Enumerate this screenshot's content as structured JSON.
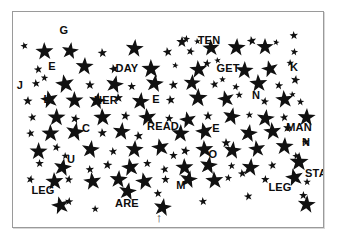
{
  "image": {
    "title": "Star field visual search puzzle",
    "background_color": "#ffffff",
    "border_color": "#9a9a9a",
    "star_color": "#111111",
    "text_color": "#0d0d0d"
  },
  "frame": {
    "x": 12,
    "y": 11,
    "width": 310,
    "height": 215
  },
  "words": [
    {
      "text": "G",
      "x": 48,
      "y": 12
    },
    {
      "text": "TEN",
      "x": 187,
      "y": 22
    },
    {
      "text": "E",
      "x": 36,
      "y": 48
    },
    {
      "text": "DAY",
      "x": 105,
      "y": 50
    },
    {
      "text": "GET",
      "x": 206,
      "y": 50
    },
    {
      "text": "K",
      "x": 278,
      "y": 49
    },
    {
      "text": "J",
      "x": 4,
      "y": 67
    },
    {
      "text": "L",
      "x": 31,
      "y": 81
    },
    {
      "text": "HER",
      "x": 84,
      "y": 82
    },
    {
      "text": "E",
      "x": 140,
      "y": 81
    },
    {
      "text": "N",
      "x": 240,
      "y": 77
    },
    {
      "text": "C",
      "x": 70,
      "y": 110
    },
    {
      "text": "READ",
      "x": 138,
      "y": 108
    },
    {
      "text": "E",
      "x": 200,
      "y": 110
    },
    {
      "text": "MAN",
      "x": 277,
      "y": 109
    },
    {
      "text": "U",
      "x": 55,
      "y": 141
    },
    {
      "text": "O",
      "x": 197,
      "y": 136
    },
    {
      "text": "N",
      "x": 290,
      "y": 124
    },
    {
      "text": "LEG",
      "x": 21,
      "y": 172
    },
    {
      "text": "M",
      "x": 165,
      "y": 167
    },
    {
      "text": "LEG",
      "x": 258,
      "y": 169
    },
    {
      "text": "STAR",
      "x": 295,
      "y": 155
    },
    {
      "text": "ARE",
      "x": 105,
      "y": 185
    }
  ],
  "marker": {
    "icon": "up-arrow-icon",
    "glyph": "↑",
    "x": 146,
    "y": 205,
    "size": 13
  },
  "stars": [
    {
      "x": 6,
      "y": 24,
      "s": 8
    },
    {
      "x": 22,
      "y": 30,
      "s": 19
    },
    {
      "x": 48,
      "y": 30,
      "s": 18
    },
    {
      "x": 84,
      "y": 32,
      "s": 10
    },
    {
      "x": 112,
      "y": 27,
      "s": 19
    },
    {
      "x": 149,
      "y": 31,
      "s": 10
    },
    {
      "x": 163,
      "y": 22,
      "s": 12
    },
    {
      "x": 174,
      "y": 30,
      "s": 9
    },
    {
      "x": 189,
      "y": 27,
      "s": 18
    },
    {
      "x": 170,
      "y": 17,
      "s": 8
    },
    {
      "x": 180,
      "y": 19,
      "s": 7
    },
    {
      "x": 214,
      "y": 26,
      "s": 19
    },
    {
      "x": 233,
      "y": 20,
      "s": 10
    },
    {
      "x": 243,
      "y": 26,
      "s": 18
    },
    {
      "x": 261,
      "y": 20,
      "s": 7
    },
    {
      "x": 276,
      "y": 14,
      "s": 9
    },
    {
      "x": 278,
      "y": 30,
      "s": 8
    },
    {
      "x": 20,
      "y": 48,
      "s": 9
    },
    {
      "x": 62,
      "y": 45,
      "s": 19
    },
    {
      "x": 95,
      "y": 48,
      "s": 10
    },
    {
      "x": 128,
      "y": 47,
      "s": 20
    },
    {
      "x": 160,
      "y": 43,
      "s": 7
    },
    {
      "x": 176,
      "y": 48,
      "s": 19
    },
    {
      "x": 190,
      "y": 42,
      "s": 9
    },
    {
      "x": 200,
      "y": 38,
      "s": 7
    },
    {
      "x": 222,
      "y": 49,
      "s": 19
    },
    {
      "x": 248,
      "y": 48,
      "s": 18
    },
    {
      "x": 273,
      "y": 41,
      "s": 8
    },
    {
      "x": 278,
      "y": 59,
      "s": 10
    },
    {
      "x": 18,
      "y": 62,
      "s": 9
    },
    {
      "x": 28,
      "y": 56,
      "s": 8
    },
    {
      "x": 42,
      "y": 62,
      "s": 20
    },
    {
      "x": 72,
      "y": 64,
      "s": 10
    },
    {
      "x": 92,
      "y": 63,
      "s": 19
    },
    {
      "x": 114,
      "y": 65,
      "s": 9
    },
    {
      "x": 132,
      "y": 62,
      "s": 19
    },
    {
      "x": 155,
      "y": 64,
      "s": 10
    },
    {
      "x": 170,
      "y": 62,
      "s": 18
    },
    {
      "x": 196,
      "y": 63,
      "s": 9
    },
    {
      "x": 206,
      "y": 57,
      "s": 7
    },
    {
      "x": 220,
      "y": 65,
      "s": 8
    },
    {
      "x": 236,
      "y": 62,
      "s": 19
    },
    {
      "x": 262,
      "y": 64,
      "s": 9
    },
    {
      "x": 275,
      "y": 72,
      "s": 7
    },
    {
      "x": 10,
      "y": 80,
      "s": 10
    },
    {
      "x": 27,
      "y": 78,
      "s": 19
    },
    {
      "x": 52,
      "y": 79,
      "s": 19
    },
    {
      "x": 75,
      "y": 80,
      "s": 18
    },
    {
      "x": 100,
      "y": 77,
      "s": 10
    },
    {
      "x": 118,
      "y": 80,
      "s": 19
    },
    {
      "x": 152,
      "y": 79,
      "s": 10
    },
    {
      "x": 175,
      "y": 76,
      "s": 20
    },
    {
      "x": 204,
      "y": 78,
      "s": 18
    },
    {
      "x": 222,
      "y": 73,
      "s": 8
    },
    {
      "x": 248,
      "y": 80,
      "s": 9
    },
    {
      "x": 262,
      "y": 78,
      "s": 19
    },
    {
      "x": 284,
      "y": 80,
      "s": 8
    },
    {
      "x": 14,
      "y": 96,
      "s": 9
    },
    {
      "x": 34,
      "y": 96,
      "s": 19
    },
    {
      "x": 58,
      "y": 98,
      "s": 10
    },
    {
      "x": 80,
      "y": 96,
      "s": 19
    },
    {
      "x": 108,
      "y": 95,
      "s": 10
    },
    {
      "x": 125,
      "y": 96,
      "s": 19
    },
    {
      "x": 152,
      "y": 97,
      "s": 9
    },
    {
      "x": 166,
      "y": 99,
      "s": 18
    },
    {
      "x": 190,
      "y": 95,
      "s": 10
    },
    {
      "x": 209,
      "y": 95,
      "s": 19
    },
    {
      "x": 232,
      "y": 93,
      "s": 8
    },
    {
      "x": 243,
      "y": 97,
      "s": 19
    },
    {
      "x": 266,
      "y": 96,
      "s": 9
    },
    {
      "x": 284,
      "y": 96,
      "s": 19
    },
    {
      "x": 12,
      "y": 112,
      "s": 9
    },
    {
      "x": 28,
      "y": 112,
      "s": 19
    },
    {
      "x": 52,
      "y": 110,
      "s": 20
    },
    {
      "x": 84,
      "y": 112,
      "s": 10
    },
    {
      "x": 99,
      "y": 110,
      "s": 19
    },
    {
      "x": 120,
      "y": 115,
      "s": 10
    },
    {
      "x": 158,
      "y": 112,
      "s": 19
    },
    {
      "x": 182,
      "y": 110,
      "s": 19
    },
    {
      "x": 208,
      "y": 122,
      "s": 10
    },
    {
      "x": 226,
      "y": 112,
      "s": 19
    },
    {
      "x": 250,
      "y": 110,
      "s": 19
    },
    {
      "x": 270,
      "y": 107,
      "s": 10
    },
    {
      "x": 288,
      "y": 120,
      "s": 8
    },
    {
      "x": 16,
      "y": 130,
      "s": 19
    },
    {
      "x": 40,
      "y": 126,
      "s": 9
    },
    {
      "x": 48,
      "y": 134,
      "s": 8
    },
    {
      "x": 68,
      "y": 128,
      "s": 19
    },
    {
      "x": 95,
      "y": 130,
      "s": 9
    },
    {
      "x": 112,
      "y": 128,
      "s": 19
    },
    {
      "x": 138,
      "y": 126,
      "s": 19
    },
    {
      "x": 156,
      "y": 134,
      "s": 9
    },
    {
      "x": 168,
      "y": 130,
      "s": 10
    },
    {
      "x": 182,
      "y": 128,
      "s": 19
    },
    {
      "x": 210,
      "y": 129,
      "s": 19
    },
    {
      "x": 235,
      "y": 128,
      "s": 18
    },
    {
      "x": 262,
      "y": 125,
      "s": 19
    },
    {
      "x": 278,
      "y": 134,
      "s": 8
    },
    {
      "x": 22,
      "y": 142,
      "s": 9
    },
    {
      "x": 40,
      "y": 146,
      "s": 19
    },
    {
      "x": 72,
      "y": 148,
      "s": 9
    },
    {
      "x": 90,
      "y": 144,
      "s": 10
    },
    {
      "x": 108,
      "y": 146,
      "s": 19
    },
    {
      "x": 130,
      "y": 142,
      "s": 9
    },
    {
      "x": 146,
      "y": 148,
      "s": 9
    },
    {
      "x": 162,
      "y": 146,
      "s": 19
    },
    {
      "x": 186,
      "y": 144,
      "s": 19
    },
    {
      "x": 214,
      "y": 144,
      "s": 8
    },
    {
      "x": 228,
      "y": 146,
      "s": 19
    },
    {
      "x": 254,
      "y": 144,
      "s": 9
    },
    {
      "x": 276,
      "y": 140,
      "s": 20
    },
    {
      "x": 14,
      "y": 158,
      "s": 9
    },
    {
      "x": 32,
      "y": 160,
      "s": 19
    },
    {
      "x": 52,
      "y": 158,
      "s": 9
    },
    {
      "x": 70,
      "y": 160,
      "s": 19
    },
    {
      "x": 96,
      "y": 158,
      "s": 19
    },
    {
      "x": 122,
      "y": 160,
      "s": 19
    },
    {
      "x": 148,
      "y": 158,
      "s": 9
    },
    {
      "x": 166,
      "y": 158,
      "s": 19
    },
    {
      "x": 192,
      "y": 159,
      "s": 19
    },
    {
      "x": 212,
      "y": 156,
      "s": 8
    },
    {
      "x": 224,
      "y": 152,
      "s": 9
    },
    {
      "x": 248,
      "y": 158,
      "s": 9
    },
    {
      "x": 272,
      "y": 156,
      "s": 19
    },
    {
      "x": 290,
      "y": 160,
      "s": 8
    },
    {
      "x": 105,
      "y": 170,
      "s": 19
    },
    {
      "x": 140,
      "y": 172,
      "s": 9
    },
    {
      "x": 52,
      "y": 180,
      "s": 9
    },
    {
      "x": 230,
      "y": 175,
      "s": 9
    },
    {
      "x": 286,
      "y": 174,
      "s": 9
    },
    {
      "x": 38,
      "y": 184,
      "s": 19
    },
    {
      "x": 78,
      "y": 187,
      "s": 8
    },
    {
      "x": 140,
      "y": 186,
      "s": 19
    },
    {
      "x": 185,
      "y": 180,
      "s": 9
    },
    {
      "x": 284,
      "y": 183,
      "s": 19
    }
  ]
}
